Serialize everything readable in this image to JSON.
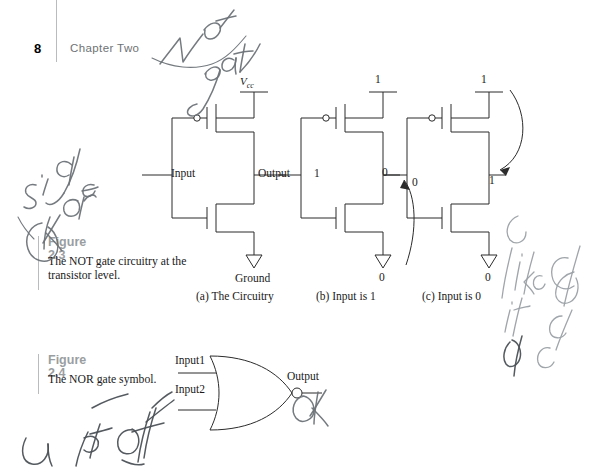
{
  "page": {
    "number": "8",
    "chapter": "Chapter Two",
    "background_color": "#ffffff",
    "rule_color": "#b9bcbe",
    "ink_color": "#2b2b2b",
    "caption_title_color": "#9a9ea1",
    "handwriting_color": "#6d7378"
  },
  "figures": [
    {
      "id": "2.3",
      "title": "Figure 2.3",
      "text": "The NOT gate circuitry at the transistor level.",
      "subcaptions": [
        "(a) The Circuitry",
        "(b) Input is 1",
        "(c) Input is 0"
      ]
    },
    {
      "id": "2.4",
      "title": "Figure 2.4",
      "text": "The NOR gate symbol."
    }
  ],
  "circuit_a": {
    "supply_label": "V",
    "supply_sub": "cc",
    "input_label": "Input",
    "output_label": "Output",
    "ground_label": "Ground"
  },
  "circuit_b": {
    "supply_value": "1",
    "input_value": "1",
    "output_value": "0",
    "ground_value": "0"
  },
  "circuit_c": {
    "supply_value": "1",
    "input_value": "0",
    "output_value": "1",
    "ground_value": "0"
  },
  "nor_gate": {
    "input1_label": "Input1",
    "input2_label": "Input2",
    "output_label": "Output"
  },
  "annotations": [
    {
      "id": "not-gate",
      "text": "Not gate"
    },
    {
      "id": "left-note",
      "text": "it is cry / ore"
    },
    {
      "id": "ok-mark",
      "text": "Ok"
    },
    {
      "id": "right-note",
      "text": "like it is / open / closed"
    },
    {
      "id": "bottom-note",
      "text": "input off / or"
    }
  ]
}
